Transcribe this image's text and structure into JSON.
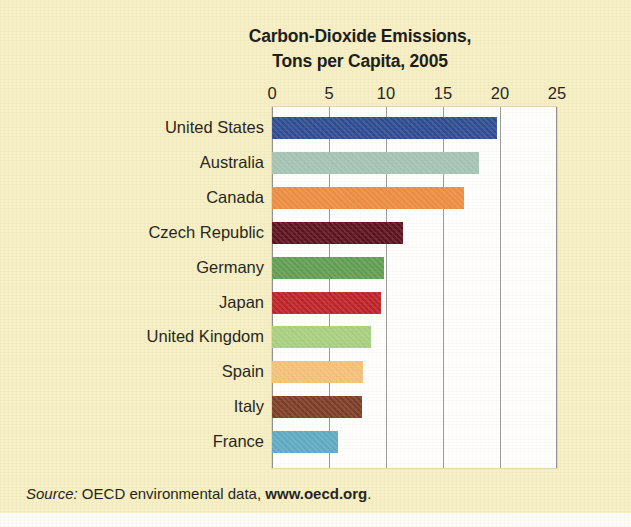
{
  "figure": {
    "background_color": "#F7F0C6",
    "plot_background_color": "#FFFFFF",
    "gridline_color": "#9A9A9A",
    "text_color": "#231F20"
  },
  "title": {
    "line1": "Carbon-Dioxide Emissions,",
    "line2": "Tons per Capita, 2005"
  },
  "source": {
    "label": "Source:",
    "text": " OECD environmental data, ",
    "url": "www.oecd.org",
    "period": "."
  },
  "chart_data": {
    "type": "bar",
    "orientation": "horizontal",
    "title": "Carbon-Dioxide Emissions, Tons per Capita, 2005",
    "xlabel": "",
    "ylabel": "",
    "xlim": [
      0,
      25
    ],
    "xticks": [
      0,
      5,
      10,
      15,
      20,
      25
    ],
    "xtick_labels": [
      "0",
      "5",
      "10",
      "15",
      "20",
      "25"
    ],
    "grid": true,
    "grid_axis": "x",
    "legend": false,
    "categories": [
      "United States",
      "Australia",
      "Canada",
      "Czech Republic",
      "Germany",
      "Japan",
      "United Kingdom",
      "Spain",
      "Italy",
      "France"
    ],
    "values": [
      19.7,
      18.2,
      16.8,
      11.5,
      9.8,
      9.6,
      8.7,
      8.0,
      7.9,
      5.8
    ],
    "bar_colors": [
      "#2A4A93",
      "#A3C3B5",
      "#ED8B40",
      "#5C0F1E",
      "#5E9E52",
      "#BE2027",
      "#A6D080",
      "#F5C078",
      "#7C3A26",
      "#5BAAC4"
    ],
    "series": [
      {
        "name": "Tons per capita, 2005",
        "values": [
          19.7,
          18.2,
          16.8,
          11.5,
          9.8,
          9.6,
          8.7,
          8.0,
          7.9,
          5.8
        ]
      }
    ]
  }
}
